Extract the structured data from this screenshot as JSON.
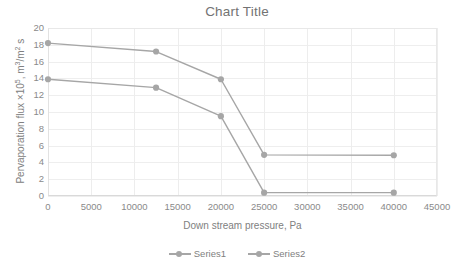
{
  "chart_data": {
    "type": "line",
    "title": "Chart Title",
    "xlabel": "Down stream pressure, Pa",
    "ylabel": "Pervaporation flux ×10⁵, m³/m² s",
    "ylabel_parts": {
      "pre": "Pervaporation flux ×10",
      "sup1": "5",
      "mid": ", m",
      "sup2": "3",
      "slash": "/m",
      "sup3": "2",
      "post": " s"
    },
    "xlim": [
      0,
      45000
    ],
    "ylim": [
      0,
      20
    ],
    "xticks": [
      0,
      5000,
      10000,
      15000,
      20000,
      25000,
      30000,
      35000,
      40000,
      45000
    ],
    "xtick_labels": [
      "0",
      "5000",
      "10000",
      "15000",
      "20000",
      "25000",
      "30000",
      "35000",
      "40000",
      "45000"
    ],
    "yticks": [
      0,
      2,
      4,
      6,
      8,
      10,
      12,
      14,
      16,
      18,
      20
    ],
    "ytick_labels": [
      "0",
      "2",
      "4",
      "6",
      "8",
      "10",
      "12",
      "14",
      "16",
      "18",
      "20"
    ],
    "grid": true,
    "legend_position": "bottom",
    "series": [
      {
        "name": "Series1",
        "color": "#a6a6a6",
        "x": [
          0,
          12500,
          20000,
          25000,
          40000
        ],
        "values": [
          13.9,
          12.9,
          9.5,
          0.4,
          0.4
        ]
      },
      {
        "name": "Series2",
        "color": "#a6a6a6",
        "x": [
          0,
          12500,
          20000,
          25000,
          40000
        ],
        "values": [
          18.2,
          17.2,
          13.9,
          4.9,
          4.85
        ]
      }
    ]
  },
  "colors": {
    "series_line": "#a6a6a6",
    "grid": "#eeeeee",
    "axis_text": "#8a8a8a",
    "title_text": "#737373"
  }
}
